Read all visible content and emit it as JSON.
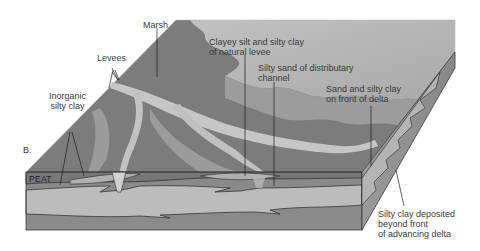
{
  "figure": {
    "panel_letter": "B."
  },
  "labels": {
    "marsh": "Marsh",
    "levees": "Levees",
    "inorganic_silty_clay": "Inorganic\nsilty clay",
    "clayey_silt": "Clayey silt and silty clay\nof natural levee",
    "silty_sand": "Silty sand of distributary\nchannel",
    "sand_front": "Sand and silty clay\non front of delta",
    "silty_clay_deposited": "Silty clay deposited\nbeyond front\nof advancing delta",
    "peat": "PEAT"
  },
  "colors": {
    "background": "#ffffff",
    "marsh_surface": "#7a7a7a",
    "water_sea": "#b4b4b4",
    "levee_light": "#c4c4c4",
    "front_dark": "#8a8a8a",
    "front_light_layer": "#b9b9b9",
    "right_face": "#8e8e8e",
    "outline": "#2a2a2a",
    "label_text": "#3a3a3a"
  }
}
